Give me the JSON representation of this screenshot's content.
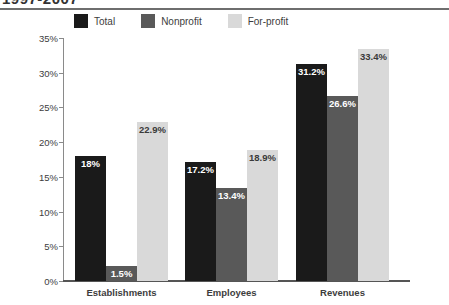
{
  "title": "1997-2007",
  "legend": {
    "position": "top",
    "items": [
      {
        "label": "Total",
        "color": "#1a1a1a"
      },
      {
        "label": "Nonprofit",
        "color": "#595959"
      },
      {
        "label": "For-profit",
        "color": "#d9d9d9"
      }
    ]
  },
  "chart_data": {
    "type": "bar",
    "title": "1997-2007",
    "xlabel": "",
    "ylabel": "",
    "ylim": [
      0,
      35
    ],
    "ytick_labels": [
      "0%",
      "5%",
      "10%",
      "15%",
      "20%",
      "25%",
      "30%",
      "35%"
    ],
    "ytick_values": [
      0,
      5,
      10,
      15,
      20,
      25,
      30,
      35
    ],
    "grid": false,
    "categories": [
      "Establishments",
      "Employees",
      "Revenues"
    ],
    "series": [
      {
        "name": "Total",
        "color": "#1a1a1a",
        "values": [
          18.0,
          17.2,
          31.2
        ],
        "labels": [
          "18%",
          "17.2%",
          "31.2%"
        ]
      },
      {
        "name": "Nonprofit",
        "color": "#595959",
        "values": [
          1.5,
          13.4,
          26.6
        ],
        "labels": [
          "1.5%",
          "13.4%",
          "26.6%"
        ]
      },
      {
        "name": "For-profit",
        "color": "#d9d9d9",
        "values": [
          22.9,
          18.9,
          33.4
        ],
        "labels": [
          "22.9%",
          "18.9%",
          "33.4%"
        ]
      }
    ]
  }
}
